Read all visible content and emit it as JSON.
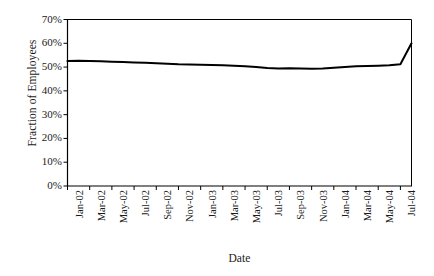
{
  "chart_data": {
    "type": "line",
    "title": "",
    "xlabel": "Date",
    "ylabel": "Fraction of Employees",
    "ylim": [
      0,
      0.7
    ],
    "ytick_labels": [
      "70%",
      "60%",
      "50%",
      "40%",
      "30%",
      "20%",
      "10%",
      "0%"
    ],
    "ytick_values": [
      0.7,
      0.6,
      0.5,
      0.4,
      0.3,
      0.2,
      0.1,
      0.0
    ],
    "xtick_labels": [
      "Jan-02",
      "Mar-02",
      "May-02",
      "Jul-02",
      "Sep-02",
      "Nov-02",
      "Jan-03",
      "Mar-03",
      "May-03",
      "Jul-03",
      "Sep-03",
      "Nov-03",
      "Jan-04",
      "Mar-04",
      "May-04",
      "Jul-04"
    ],
    "grid": false,
    "legend": false,
    "line_color": "#000000",
    "series": [
      {
        "name": "Fraction of Employees",
        "x": [
          "Jan-02",
          "Feb-02",
          "Mar-02",
          "Apr-02",
          "May-02",
          "Jun-02",
          "Jul-02",
          "Aug-02",
          "Sep-02",
          "Oct-02",
          "Nov-02",
          "Dec-02",
          "Jan-03",
          "Feb-03",
          "Mar-03",
          "Apr-03",
          "May-03",
          "Jun-03",
          "Jul-03",
          "Aug-03",
          "Sep-03",
          "Oct-03",
          "Nov-03",
          "Dec-03",
          "Jan-04",
          "Feb-04",
          "Mar-04",
          "Apr-04",
          "May-04",
          "Jun-04",
          "Jul-04",
          "Aug-04"
        ],
        "values": [
          0.525,
          0.527,
          0.526,
          0.524,
          0.522,
          0.521,
          0.519,
          0.518,
          0.516,
          0.514,
          0.512,
          0.511,
          0.51,
          0.509,
          0.508,
          0.506,
          0.503,
          0.5,
          0.496,
          0.494,
          0.495,
          0.494,
          0.493,
          0.494,
          0.497,
          0.5,
          0.503,
          0.505,
          0.506,
          0.508,
          0.512,
          0.6
        ]
      }
    ],
    "annotations": [
      "Sharp rise at the end of the series from about 51% to about 60%"
    ]
  }
}
